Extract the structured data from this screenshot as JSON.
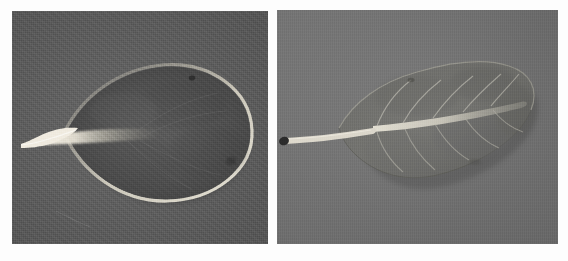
{
  "figure": {
    "background_color": "#fdfdfd",
    "panel_count": 2
  },
  "panels": [
    {
      "id": "panel-left",
      "name": "left-leaf-photograph",
      "label": "",
      "background_color": "#575757",
      "background_description": "dark gray coarse woven/canvas textured backdrop",
      "subject": {
        "type": "pressed leaf specimen",
        "shape": "obovate",
        "orientation": "horizontal, petiole pointing left, apex at right",
        "blade_color": "#4a4a4a",
        "blade_description": "broad dark obovate blade, widest near the apex, rounded rounded-truncate tip",
        "midrib_color": "#d8d4c6",
        "midrib_description": "bright pale midrib running from the petiole into the centre of the blade",
        "petiole_color": "#e8e4d6",
        "petiole_description": "flattened whitish petiole extending to the left margin",
        "margin_highlight": "#cfc9b8",
        "venation_visible": "faint"
      }
    },
    {
      "id": "panel-right",
      "name": "right-leaf-photograph",
      "label": "",
      "background_color": "#6d6d6d",
      "background_description": "medium gray smooth paper backdrop with slight mottling",
      "subject": {
        "type": "pressed leaf specimen",
        "shape": "elliptic-ovate",
        "orientation": "oblique, petiole pointing left-down, apex at upper right",
        "blade_color": "#6a6a68",
        "blade_description": "elliptic blade with acute apex, showing pinnate secondary veins",
        "midrib_color": "#c8c6bc",
        "midrib_description": "pale midrib running the full length of the blade",
        "petiole_color": "#ded9cc",
        "petiole_description": "long slender pale petiole reaching the left edge of the panel",
        "petiole_tip_color": "#1e1e1e",
        "petiole_tip_description": "dark cut end at the base of the petiole",
        "vein_color": "#b9b7ab",
        "vein_pairs": 6,
        "venation_visible": "distinct pinnate venation"
      }
    }
  ],
  "colors": {
    "page": "#fdfdfd",
    "panel_left_bg": "#575757",
    "panel_right_bg": "#6d6d6d",
    "leaf_dark": "#454545",
    "leaf_mid": "#6a6a68",
    "highlight": "#e3dfd2",
    "shadow": "#2e2e2e"
  }
}
